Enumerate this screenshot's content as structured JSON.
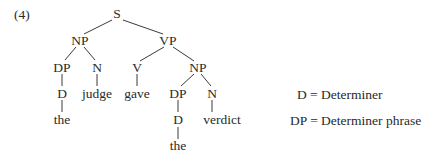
{
  "example_number": "(4)",
  "tree": {
    "nodes": {
      "s": "S",
      "np1": "NP",
      "vp": "VP",
      "dp1": "DP",
      "n1": "N",
      "v": "V",
      "np2": "NP",
      "d1": "D",
      "judge": "judge",
      "gave": "gave",
      "dp2": "DP",
      "n2": "N",
      "the1": "the",
      "d2": "D",
      "verdict": "verdict",
      "the2": "the"
    }
  },
  "legend": [
    {
      "text": "D = Determiner"
    },
    {
      "text": "DP = Determiner phrase"
    }
  ],
  "colors": {
    "ink": "#2a2a2a",
    "background": "#ffffff"
  }
}
